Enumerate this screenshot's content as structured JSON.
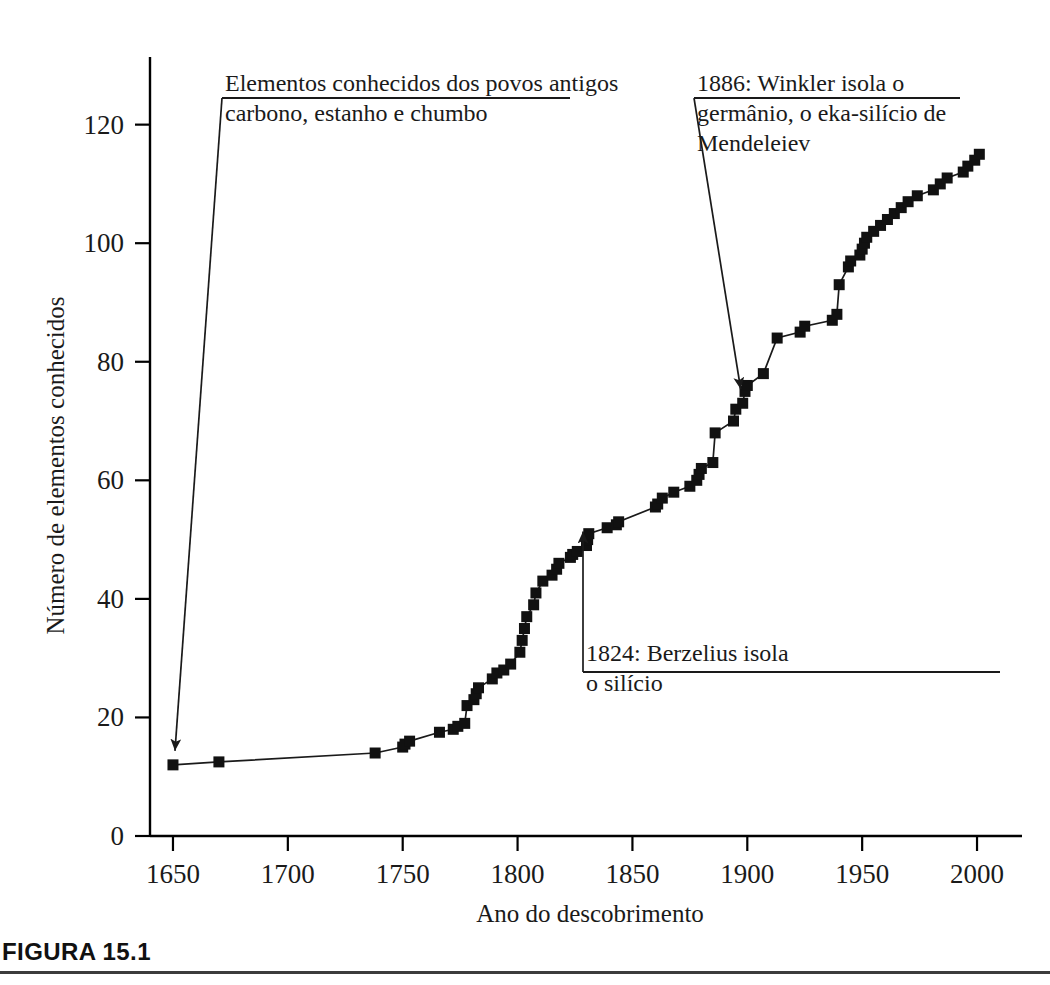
{
  "figure": {
    "caption_label": "FIGURA 15.1"
  },
  "chart_data": {
    "type": "line",
    "title": "",
    "xlabel": "Ano do descobrimento",
    "ylabel": "Número de elementos conhecidos",
    "xlim": [
      1640,
      2010
    ],
    "ylim": [
      0,
      125
    ],
    "grid": false,
    "legend": "none",
    "marker": "square",
    "xticks": [
      1650,
      1700,
      1750,
      1800,
      1850,
      1900,
      1950,
      2000
    ],
    "xtick_labels": [
      "1650",
      "1700",
      "1750",
      "1800",
      "1850",
      "1900",
      "1950",
      "2000"
    ],
    "yticks": [
      0,
      20,
      40,
      60,
      80,
      100,
      120
    ],
    "ytick_labels": [
      "0",
      "20",
      "40",
      "60",
      "80",
      "100",
      "120"
    ],
    "series": [
      {
        "name": "Elementos conhecidos",
        "points": [
          [
            1650,
            12
          ],
          [
            1670,
            12.5
          ],
          [
            1738,
            14
          ],
          [
            1750,
            15
          ],
          [
            1751,
            15.5
          ],
          [
            1753,
            16
          ],
          [
            1766,
            17.5
          ],
          [
            1772,
            18
          ],
          [
            1774,
            18.5
          ],
          [
            1777,
            19
          ],
          [
            1778,
            22
          ],
          [
            1781,
            23
          ],
          [
            1782,
            24
          ],
          [
            1783,
            25
          ],
          [
            1789,
            26.5
          ],
          [
            1791,
            27.5
          ],
          [
            1794,
            28
          ],
          [
            1797,
            29
          ],
          [
            1801,
            31
          ],
          [
            1802,
            33
          ],
          [
            1803,
            35
          ],
          [
            1804,
            37
          ],
          [
            1807,
            39
          ],
          [
            1808,
            41
          ],
          [
            1811,
            43
          ],
          [
            1815,
            44
          ],
          [
            1817,
            45
          ],
          [
            1818,
            46
          ],
          [
            1823,
            47
          ],
          [
            1824,
            47.5
          ],
          [
            1826,
            48
          ],
          [
            1830,
            49
          ],
          [
            1830.5,
            50
          ],
          [
            1831,
            51
          ],
          [
            1839,
            52
          ],
          [
            1843,
            52.5
          ],
          [
            1844,
            53
          ],
          [
            1860,
            55.5
          ],
          [
            1861,
            56
          ],
          [
            1863,
            57
          ],
          [
            1868,
            58
          ],
          [
            1875,
            59
          ],
          [
            1878,
            60
          ],
          [
            1879,
            61
          ],
          [
            1880,
            62
          ],
          [
            1885,
            63
          ],
          [
            1886,
            68
          ],
          [
            1894,
            70
          ],
          [
            1895,
            72
          ],
          [
            1898,
            73
          ],
          [
            1899,
            75
          ],
          [
            1900,
            76
          ],
          [
            1907,
            78
          ],
          [
            1913,
            84
          ],
          [
            1923,
            85
          ],
          [
            1925,
            86
          ],
          [
            1937,
            87
          ],
          [
            1939,
            88
          ],
          [
            1940,
            93
          ],
          [
            1944,
            96
          ],
          [
            1945,
            97
          ],
          [
            1949,
            98
          ],
          [
            1950,
            99
          ],
          [
            1951,
            100
          ],
          [
            1952,
            101
          ],
          [
            1955,
            102
          ],
          [
            1958,
            103
          ],
          [
            1961,
            104
          ],
          [
            1964,
            105
          ],
          [
            1967,
            106
          ],
          [
            1970,
            107
          ],
          [
            1974,
            108
          ],
          [
            1981,
            109
          ],
          [
            1984,
            110
          ],
          [
            1987,
            111
          ],
          [
            1994,
            112
          ],
          [
            1996,
            113
          ],
          [
            1999,
            114
          ],
          [
            2001,
            115
          ]
        ]
      }
    ],
    "annotations": [
      {
        "id": "ancient-elements",
        "text": "Elementos conhecidos dos povos antigos\ncarbono, estanho e chumbo",
        "target_x": 1650,
        "target_y": 12
      },
      {
        "id": "winkler-germanium",
        "text": "1886: Winkler isola o\ngermânio, o eka-silício de\nMendeleiev",
        "target_x": 1898,
        "target_y": 73
      },
      {
        "id": "berzelius-silicon",
        "text": "1824: Berzelius isola\no silício",
        "target_x": 1831,
        "target_y": 49
      }
    ]
  }
}
